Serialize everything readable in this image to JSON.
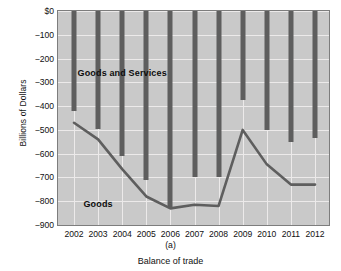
{
  "chart_data": {
    "type": "bar",
    "title": "",
    "subtitle": "",
    "xlabel": "Balance of trade",
    "ylabel": "Billions of Dollars",
    "panel_label": "(a)",
    "categories": [
      "2002",
      "2003",
      "2004",
      "2005",
      "2006",
      "2007",
      "2008",
      "2009",
      "2010",
      "2011",
      "2012"
    ],
    "ylim": [
      -900,
      0
    ],
    "yticks": [
      0,
      -100,
      -200,
      -300,
      -400,
      -500,
      -600,
      -700,
      -800,
      -900
    ],
    "ytick_labels": [
      "$0",
      "−100",
      "−200",
      "−300",
      "−400",
      "−500",
      "−600",
      "−700",
      "−800",
      "−900"
    ],
    "grid": true,
    "legend_position": "inline-annotations",
    "series": [
      {
        "name": "Goods and Services",
        "type": "bar",
        "note": "vertical bars drawn from $0 down to the value",
        "values": [
          -420,
          -495,
          -610,
          -710,
          -830,
          -700,
          -700,
          -375,
          -500,
          -550,
          -535
        ]
      },
      {
        "name": "Goods",
        "type": "line",
        "values": [
          -470,
          -540,
          -665,
          -780,
          -830,
          -815,
          -820,
          -500,
          -645,
          -730,
          -730
        ]
      }
    ],
    "annotations": [
      {
        "text": "Goods and Services",
        "x": "2004",
        "y": -260
      },
      {
        "text": "Goods",
        "x": "2003",
        "y": -812
      }
    ],
    "colors": {
      "plot_background": "#c9c9c9",
      "grid": "#eceaea",
      "bar": "#5e5e5e",
      "line": "#5e5e5e",
      "frame": "#7d7d7d",
      "text": "#111111"
    }
  }
}
